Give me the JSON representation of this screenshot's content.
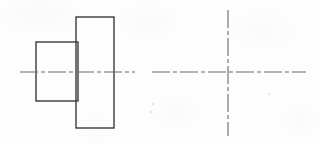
{
  "drawing": {
    "title": "Stepped Shaft Two-View Orthographic Sketch",
    "sheet": {
      "width": 320,
      "height": 144,
      "background_color": "#fdfdfd",
      "medium": "scanned paper"
    },
    "style": {
      "outline_color": "#3a3a3a",
      "outline_width": 1.4,
      "centerline_color": "#6a6a6a",
      "centerline_width": 1.1,
      "centerline_dash_pattern": "18 3 4 3"
    },
    "views": [
      {
        "name": "front-view",
        "label": "Front View (stepped profile)",
        "shapes": [
          {
            "name": "small-step-rectangle",
            "role": "smaller diameter step",
            "x": 36,
            "y": 42,
            "width": 42,
            "height": 59
          },
          {
            "name": "large-flange-rectangle",
            "role": "larger diameter flange",
            "x": 76,
            "y": 17,
            "width": 38,
            "height": 111
          }
        ],
        "centerlines": [
          {
            "name": "horizontal-axis-centerline",
            "orientation": "horizontal",
            "x1": 20,
            "y1": 72,
            "x2": 135,
            "y2": 72
          }
        ]
      },
      {
        "name": "end-view",
        "label": "End View (axes only)",
        "shapes": [],
        "centerlines": [
          {
            "name": "horizontal-axis-centerline",
            "orientation": "horizontal",
            "x1": 152,
            "y1": 72,
            "x2": 306,
            "y2": 72
          },
          {
            "name": "vertical-axis-centerline",
            "orientation": "vertical",
            "x1": 228,
            "y1": 10,
            "x2": 228,
            "y2": 136
          }
        ],
        "intersection_point": {
          "name": "view-center",
          "x": 228,
          "y": 72
        }
      }
    ],
    "artifacts": [
      {
        "name": "scan-speck",
        "x": 269,
        "y": 94,
        "size": 1.6
      },
      {
        "name": "scan-speck",
        "x": 153,
        "y": 104,
        "size": 1.2
      },
      {
        "name": "scan-speck",
        "x": 151,
        "y": 112,
        "size": 1.4
      }
    ]
  }
}
